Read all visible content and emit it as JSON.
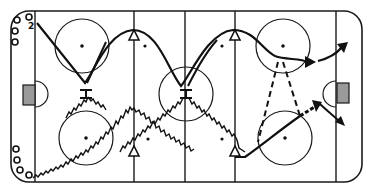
{
  "diagram": {
    "type": "hockey-drill",
    "rink": {
      "line_color": "#1a1a1a",
      "goal_fill": "#9a9a9a",
      "blue_lines": 2,
      "center_line": 1,
      "goal_lines": 2,
      "faceoff_circles": 5
    },
    "players": {
      "top_left_group": {
        "count": 4,
        "marker": "circle",
        "label": "2"
      },
      "bottom_left_group": {
        "count": 4,
        "marker": "circle"
      }
    },
    "pylons": [
      {
        "name": "cone-top-left-blue",
        "symbol": "triangle"
      },
      {
        "name": "cone-top-right-blue",
        "symbol": "triangle"
      },
      {
        "name": "cone-bottom-left-blue",
        "symbol": "triangle"
      },
      {
        "name": "cone-bottom-right-blue",
        "symbol": "triangle"
      }
    ],
    "stops": [
      {
        "name": "stop-left",
        "symbol": "pivot-bar"
      },
      {
        "name": "stop-center",
        "symbol": "pivot-bar"
      }
    ],
    "paths": {
      "skate": "solid-curve",
      "skate_with_puck": "zigzag",
      "pass": "dashed",
      "shot": "double-dashed-arrow"
    }
  }
}
